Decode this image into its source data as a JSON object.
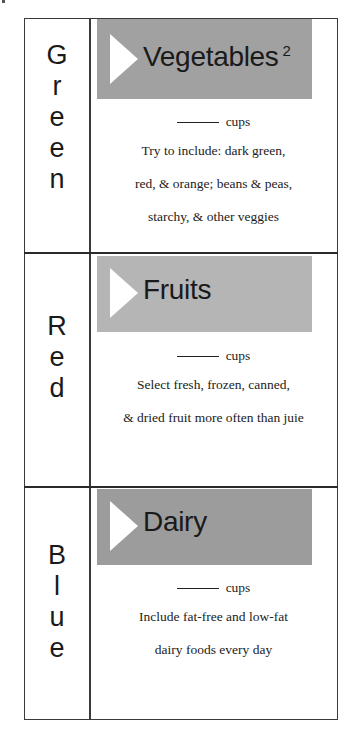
{
  "colors": {
    "border": "#3a3a3a",
    "vegetables_box": "#a1a1a1",
    "fruits_box": "#b5b5b5",
    "dairy_box": "#9c9c9c",
    "triangle": "#ffffff"
  },
  "rows": [
    {
      "color_word": "Green",
      "letters": [
        "G",
        "r",
        "e",
        "e",
        "n"
      ],
      "title": "Vegetables",
      "footnote": "2",
      "amount_unit": "cups",
      "description_lines": [
        "Try to include: dark green,",
        "red, & orange; beans & peas,",
        "starchy, & other veggies"
      ]
    },
    {
      "color_word": "Red",
      "letters": [
        "R",
        "e",
        "d"
      ],
      "title": "Fruits",
      "amount_unit": "cups",
      "description_lines": [
        "Select fresh, frozen, canned,",
        "& dried fruit more often than juie"
      ]
    },
    {
      "color_word": "Blue",
      "letters": [
        "B",
        "l",
        "u",
        "e"
      ],
      "title": "Dairy",
      "amount_unit": "cups",
      "description_lines": [
        "Include fat-free and low-fat",
        "dairy foods every day"
      ]
    }
  ]
}
